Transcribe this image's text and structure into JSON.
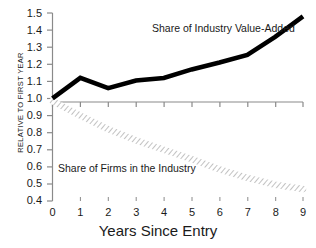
{
  "chart_data": {
    "type": "line",
    "title": "",
    "xlabel": "Years Since Entry",
    "ylabel": "RELATIVE TO FIRST YEAR",
    "x": [
      0,
      1,
      2,
      3,
      4,
      5,
      6,
      7,
      8,
      9
    ],
    "xlim": [
      0,
      9
    ],
    "ylim": [
      0.4,
      1.5
    ],
    "grid": false,
    "legend_position": "inline-annotations",
    "xticks": [
      "0",
      "1",
      "2",
      "3",
      "4",
      "5",
      "6",
      "7",
      "8",
      "9"
    ],
    "yticks": [
      "0.4",
      "0.5",
      "0.6",
      "0.7",
      "0.8",
      "0.9",
      "1.0",
      "1.1",
      "1.2",
      "1.3",
      "1.4",
      "1.5"
    ],
    "series": [
      {
        "name": "Share of Industry Value-Added",
        "style": "thick-solid-black",
        "color": "#000000",
        "values": [
          1.0,
          1.12,
          1.06,
          1.105,
          1.12,
          1.17,
          1.21,
          1.255,
          1.36,
          1.48
        ]
      },
      {
        "name": "Share of Firms in the Industry",
        "style": "hatched-outline-band",
        "color": "#9a9a9a",
        "values": [
          0.985,
          0.9,
          0.82,
          0.755,
          0.7,
          0.645,
          0.585,
          0.535,
          0.495,
          0.47
        ]
      }
    ],
    "annotations": [
      {
        "text": "Share of Industry Value-Added",
        "x": 4.2,
        "y": 1.43
      },
      {
        "text": "Share of Firms in the Industry",
        "x": 0.45,
        "y": 0.585
      }
    ]
  },
  "axes": {
    "x_title": "Years Since Entry",
    "y_title": "RELATIVE TO FIRST YEAR"
  },
  "annotations": {
    "value_added": "Share of Industry Value-Added",
    "firms": "Share of Firms in the Industry"
  },
  "colors": {
    "axis": "#8a8a8a",
    "text": "#1a1a1a",
    "series_value_added": "#000000",
    "series_firms": "#9a9a9a",
    "background": "#ffffff"
  }
}
